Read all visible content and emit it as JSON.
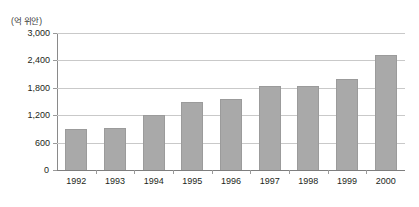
{
  "chart_data": {
    "type": "bar",
    "title": "",
    "subtitle": "",
    "unit_label": "(억 위안)",
    "xlabel": "",
    "ylabel": "",
    "categories": [
      "1992",
      "1993",
      "1994",
      "1995",
      "1996",
      "1997",
      "1998",
      "1999",
      "2000"
    ],
    "values": [
      900,
      920,
      1200,
      1500,
      1550,
      1830,
      1850,
      2000,
      2520
    ],
    "series": [
      {
        "name": "",
        "values": [
          900,
          920,
          1200,
          1500,
          1550,
          1830,
          1850,
          2000,
          2520
        ]
      }
    ],
    "ylim": [
      0,
      3000
    ],
    "yticks": [
      0,
      600,
      1200,
      1800,
      2400,
      3000
    ],
    "ytick_labels": [
      "0",
      "600",
      "1,200",
      "1,800",
      "2,400",
      "3,000"
    ],
    "grid": true,
    "legend": false,
    "legend_position": "none",
    "colors": {
      "bar_fill": "#a9a9a9",
      "bar_edge": "#9b9b9b",
      "gridline": "#c9c9c9",
      "axis": "#8a8a8a",
      "text": "#231f20",
      "background": "#ffffff"
    }
  }
}
